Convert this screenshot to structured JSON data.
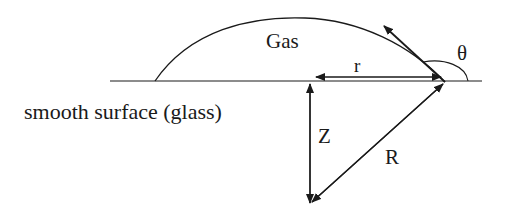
{
  "diagram": {
    "labels": {
      "gas": "Gas",
      "theta": "θ",
      "r": "r",
      "z": "Z",
      "R": "R",
      "surface": "smooth surface (glass)"
    },
    "colors": {
      "stroke": "#1a1a1a",
      "background": "#ffffff"
    }
  }
}
